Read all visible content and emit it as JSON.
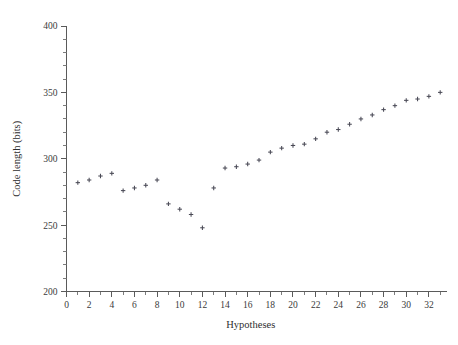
{
  "chart_data": {
    "type": "scatter",
    "title": "",
    "xlabel": "Hypotheses",
    "ylabel": "Code length (bits)",
    "xlim": [
      0,
      33.6
    ],
    "ylim": [
      200,
      400
    ],
    "grid": false,
    "legend": null,
    "marker": "plus",
    "marker_color": "#4a4a56",
    "axis_color": "#5a5a5a",
    "x_major_ticks": [
      0,
      2,
      4,
      6,
      8,
      10,
      12,
      14,
      16,
      18,
      20,
      22,
      24,
      26,
      28,
      30,
      32
    ],
    "x_major_tick_labels": [
      "0",
      "2",
      "4",
      "6",
      "8",
      "10",
      "12",
      "14",
      "16",
      "18",
      "20",
      "22",
      "24",
      "26",
      "28",
      "30",
      "32"
    ],
    "x_minor_ticks": [
      1,
      3,
      5,
      7,
      9,
      11,
      13,
      15,
      17,
      19,
      21,
      23,
      25,
      27,
      29,
      31,
      33
    ],
    "y_major_ticks": [
      200,
      250,
      300,
      350,
      400
    ],
    "y_major_tick_labels": [
      "200",
      "250",
      "300",
      "350",
      "400"
    ],
    "y_minor_ticks": [
      210,
      220,
      230,
      240,
      260,
      270,
      280,
      290,
      310,
      320,
      330,
      340,
      360,
      370,
      380,
      390
    ],
    "x": [
      1,
      2,
      3,
      4,
      5,
      6,
      7,
      8,
      9,
      10,
      11,
      12,
      13,
      14,
      15,
      16,
      17,
      18,
      19,
      20,
      21,
      22,
      23,
      24,
      25,
      26,
      27,
      28,
      29,
      30,
      31,
      32,
      33
    ],
    "values": [
      282,
      284,
      287,
      289,
      276,
      278,
      280,
      284,
      266,
      262,
      258,
      248,
      278,
      293,
      294,
      296,
      299,
      305,
      308,
      310,
      311,
      315,
      320,
      322,
      326,
      330,
      333,
      337,
      340,
      344,
      345,
      347,
      350
    ],
    "points": [
      {
        "x": 1,
        "y": 282
      },
      {
        "x": 2,
        "y": 284
      },
      {
        "x": 3,
        "y": 287
      },
      {
        "x": 4,
        "y": 289
      },
      {
        "x": 5,
        "y": 276
      },
      {
        "x": 6,
        "y": 278
      },
      {
        "x": 7,
        "y": 280
      },
      {
        "x": 8,
        "y": 284
      },
      {
        "x": 9,
        "y": 266
      },
      {
        "x": 10,
        "y": 262
      },
      {
        "x": 11,
        "y": 258
      },
      {
        "x": 12,
        "y": 248
      },
      {
        "x": 13,
        "y": 278
      },
      {
        "x": 14,
        "y": 293
      },
      {
        "x": 15,
        "y": 294
      },
      {
        "x": 16,
        "y": 296
      },
      {
        "x": 17,
        "y": 299
      },
      {
        "x": 18,
        "y": 305
      },
      {
        "x": 19,
        "y": 308
      },
      {
        "x": 20,
        "y": 310
      },
      {
        "x": 21,
        "y": 311
      },
      {
        "x": 22,
        "y": 315
      },
      {
        "x": 23,
        "y": 320
      },
      {
        "x": 24,
        "y": 322
      },
      {
        "x": 25,
        "y": 326
      },
      {
        "x": 26,
        "y": 330
      },
      {
        "x": 27,
        "y": 333
      },
      {
        "x": 28,
        "y": 337
      },
      {
        "x": 29,
        "y": 340
      },
      {
        "x": 30,
        "y": 344
      },
      {
        "x": 31,
        "y": 345
      },
      {
        "x": 32,
        "y": 347
      },
      {
        "x": 33,
        "y": 350
      }
    ]
  }
}
